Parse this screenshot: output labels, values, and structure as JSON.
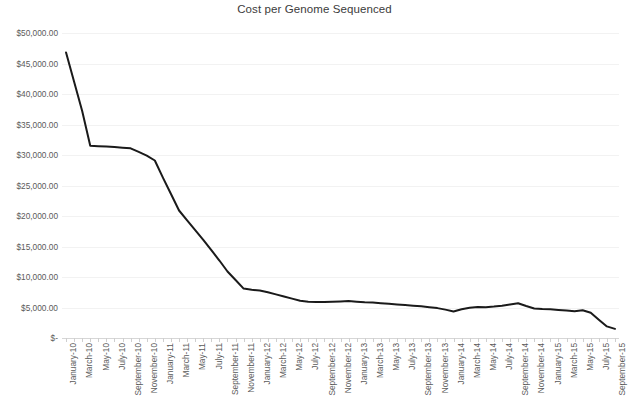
{
  "chart_data": {
    "type": "line",
    "title": "Cost per Genome Sequenced",
    "xlabel": "",
    "ylabel": "",
    "ylim": [
      0,
      50000
    ],
    "y_tick_step": 5000,
    "y_tick_labels": [
      "$50,000.00",
      "$45,000.00",
      "$40,000.00",
      "$35,000.00",
      "$30,000.00",
      "$25,000.00",
      "$20,000.00",
      "$15,000.00",
      "$10,000.00",
      "$5,000.00",
      "$-"
    ],
    "y_tick_values": [
      50000,
      45000,
      40000,
      35000,
      30000,
      25000,
      20000,
      15000,
      10000,
      5000,
      0
    ],
    "grid": true,
    "grid_axis": "y",
    "legend": "none",
    "line_color": "#1a1a1a",
    "line_width": 2,
    "markers": false,
    "x_tick_label_rotation": -90,
    "x_tick_label_interval": 2,
    "x_tick_labels": [
      "January-10",
      "March-10",
      "May-10",
      "July-10",
      "September-10",
      "November-10",
      "January-11",
      "March-11",
      "May-11",
      "July-11",
      "September-11",
      "November-11",
      "January-12",
      "March-12",
      "May-12",
      "July-12",
      "September-12",
      "November-12",
      "January-13",
      "March-13",
      "May-13",
      "July-13",
      "September-13",
      "November-13",
      "January-14",
      "March-14",
      "May-14",
      "July-14",
      "September-14",
      "November-14",
      "January-15",
      "March-15",
      "May-15",
      "July-15",
      "September-15"
    ],
    "categories": [
      "January-10",
      "February-10",
      "March-10",
      "April-10",
      "May-10",
      "June-10",
      "July-10",
      "August-10",
      "September-10",
      "October-10",
      "November-10",
      "December-10",
      "January-11",
      "February-11",
      "March-11",
      "April-11",
      "May-11",
      "June-11",
      "July-11",
      "August-11",
      "September-11",
      "October-11",
      "November-11",
      "December-11",
      "January-12",
      "February-12",
      "March-12",
      "April-12",
      "May-12",
      "June-12",
      "July-12",
      "August-12",
      "September-12",
      "October-12",
      "November-12",
      "December-12",
      "January-13",
      "February-13",
      "March-13",
      "April-13",
      "May-13",
      "June-13",
      "July-13",
      "August-13",
      "September-13",
      "October-13",
      "November-13",
      "December-13",
      "January-14",
      "February-14",
      "March-14",
      "April-14",
      "May-14",
      "June-14",
      "July-14",
      "August-14",
      "September-14",
      "October-14",
      "November-14",
      "December-14",
      "January-15",
      "February-15",
      "March-15",
      "April-15",
      "May-15",
      "June-15",
      "July-15",
      "August-15",
      "September-15"
    ],
    "values": [
      46800,
      42000,
      37200,
      31500,
      31450,
      31400,
      31300,
      31200,
      31100,
      30500,
      29900,
      29100,
      26300,
      23600,
      20900,
      19300,
      17700,
      16100,
      14400,
      12700,
      10900,
      9500,
      8100,
      7900,
      7800,
      7500,
      7150,
      6800,
      6450,
      6100,
      5950,
      5900,
      5900,
      5950,
      6000,
      6050,
      5950,
      5850,
      5800,
      5700,
      5600,
      5500,
      5400,
      5300,
      5200,
      5050,
      4900,
      4650,
      4350,
      4700,
      4950,
      5100,
      5050,
      5150,
      5300,
      5500,
      5700,
      5250,
      4850,
      4750,
      4700,
      4600,
      4500,
      4400,
      4550,
      4150,
      3000,
      1900,
      1500
    ]
  }
}
